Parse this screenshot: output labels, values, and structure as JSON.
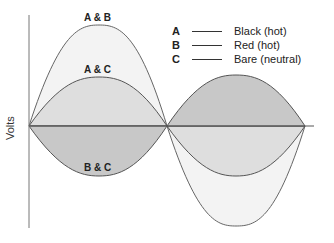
{
  "diagram": {
    "axis_label": "Volts",
    "curve_labels": {
      "ab": "A & B",
      "ac": "A & C",
      "bc": "B & C"
    },
    "legend": [
      {
        "key": "A",
        "label": "Black (hot)"
      },
      {
        "key": "B",
        "label": "Red (hot)"
      },
      {
        "key": "C",
        "label": "Bare (neutral)"
      }
    ],
    "colors": {
      "line": "#555555",
      "light_fill": "#f2f2f2",
      "mid_fill": "#e0e0e0",
      "dark_fill": "#c4c4c4"
    }
  }
}
